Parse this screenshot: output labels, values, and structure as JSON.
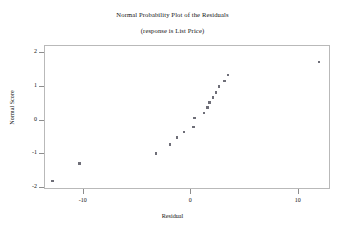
{
  "chart_data": {
    "type": "scatter",
    "title": "Normal Probability Plot of the Residuals",
    "subtitle": "(response is List Price)",
    "xlabel": "Residual",
    "ylabel": "Normal Score",
    "xlim": [
      -13.6,
      13.0
    ],
    "ylim": [
      -2.05,
      2.2
    ],
    "xticks": [
      -10,
      0,
      10
    ],
    "xtick_labels": [
      "-10",
      "0",
      "10"
    ],
    "yticks": [
      -2,
      -1,
      0,
      1,
      2
    ],
    "ytick_labels": [
      "-2",
      "-1",
      "0",
      "1",
      "2"
    ],
    "grid": false,
    "legend": null,
    "marker": "square",
    "marker_color": "#6e6e78",
    "frame_color": "#b9b9b9",
    "series": [
      {
        "name": "Residuals",
        "points": [
          {
            "x": -12.9,
            "y": -1.78
          },
          {
            "x": -10.4,
            "y": -1.27
          },
          {
            "x": -3.3,
            "y": -0.97
          },
          {
            "x": -2.0,
            "y": -0.71
          },
          {
            "x": -1.3,
            "y": -0.5
          },
          {
            "x": -0.7,
            "y": -0.33
          },
          {
            "x": 0.2,
            "y": -0.19
          },
          {
            "x": 0.3,
            "y": 0.08
          },
          {
            "x": 1.2,
            "y": 0.22
          },
          {
            "x": 1.5,
            "y": 0.39
          },
          {
            "x": 1.7,
            "y": 0.53
          },
          {
            "x": 2.0,
            "y": 0.68
          },
          {
            "x": 2.3,
            "y": 0.83
          },
          {
            "x": 2.6,
            "y": 1.0
          },
          {
            "x": 3.1,
            "y": 1.17
          },
          {
            "x": 3.4,
            "y": 1.34
          },
          {
            "x": 11.9,
            "y": 1.72
          }
        ]
      }
    ]
  }
}
